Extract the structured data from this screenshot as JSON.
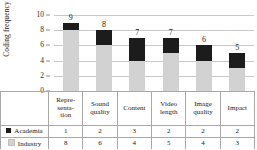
{
  "chart_data": {
    "type": "bar",
    "subtype": "stacked-bar-with-data-table",
    "title": "",
    "xlabel": "",
    "ylabel": "Coding frequency",
    "ylim": [
      0,
      10
    ],
    "yticks": [
      0,
      2,
      4,
      6,
      8,
      10
    ],
    "grid": true,
    "legend_position": "data-table-left",
    "categories": [
      "Representation",
      "Sound quality",
      "Content",
      "Video length",
      "Image quality",
      "Impact"
    ],
    "category_lines": [
      [
        "Repre-",
        "senta-",
        "tion"
      ],
      [
        "Sound",
        "quality"
      ],
      [
        "Content"
      ],
      [
        "Video",
        "length"
      ],
      [
        "Image",
        "quality"
      ],
      [
        "Impact"
      ]
    ],
    "series": [
      {
        "name": "Academia",
        "color": "#1c1c1c",
        "marker": "black-square",
        "values": [
          1,
          2,
          3,
          2,
          2,
          2
        ],
        "stack_position": "top"
      },
      {
        "name": "Industry",
        "color": "#d2d2d2",
        "marker": "gray-square",
        "values": [
          8,
          6,
          4,
          5,
          4,
          3
        ],
        "stack_position": "bottom"
      }
    ],
    "totals": [
      9,
      8,
      7,
      7,
      6,
      5
    ],
    "data_labels": [
      "9",
      "8",
      "7",
      "7",
      "6",
      "5"
    ],
    "ytick_labels": [
      "0",
      "2",
      "4",
      "6",
      "8",
      "10"
    ]
  },
  "colors": {
    "academia": "#1c1c1c",
    "industry": "#d2d2d2",
    "gridline": "#c8c8c8",
    "table_border": "#a9a9a9",
    "background": "#ffffff"
  }
}
